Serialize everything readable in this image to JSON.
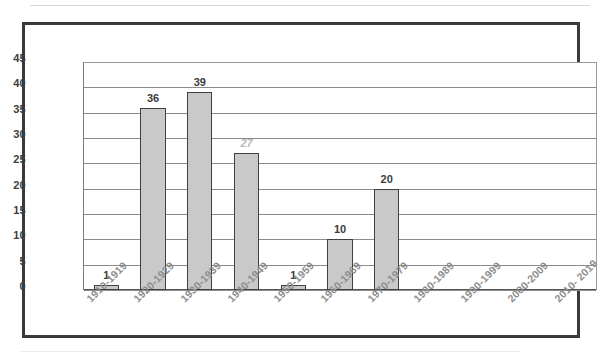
{
  "chart_data": {
    "type": "bar",
    "title": "",
    "subtitle": "",
    "xlabel": "",
    "ylabel": "",
    "categories": [
      "1910-1919",
      "1920-1929",
      "1930-1939",
      "1940-1949",
      "1950-1959",
      "1960-1969",
      "1970-1979",
      "1980-1989",
      "1990-1999",
      "2000-2009",
      "2010- 2019"
    ],
    "values": [
      1,
      36,
      39,
      27,
      1,
      10,
      20,
      0,
      0,
      0,
      0
    ],
    "data_labels": [
      "1",
      "36",
      "39",
      "27",
      "1",
      "10",
      "20",
      "",
      "",
      "",
      ""
    ],
    "ylim": [
      0,
      45
    ],
    "ytick_labels": [
      "45",
      "40",
      "35",
      "30",
      "25",
      "20",
      "15",
      "10",
      "5",
      "0"
    ],
    "ytick_values": [
      45,
      40,
      35,
      30,
      25,
      20,
      15,
      10,
      5,
      0
    ],
    "ytick_step": 5,
    "grid": true,
    "grid_axis": "y",
    "legend": false,
    "legend_position": "none",
    "bar_fill_color": "#c9c9c9",
    "bar_border_color": "#404040",
    "gridline_color": "#8c8c8c",
    "label_color": "#3b3b3b",
    "xtick_label_color": "#8d8d8d",
    "xtick_label_rotation": -45,
    "frame_color": "#3a3a3a"
  }
}
